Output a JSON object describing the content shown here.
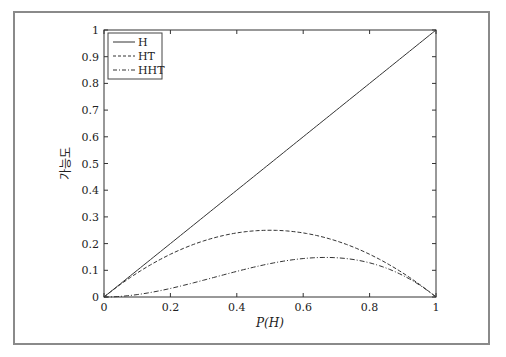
{
  "chart_data": {
    "type": "line",
    "title": "",
    "xlabel": "P(H)",
    "ylabel": "가능도",
    "xlim": [
      0,
      1
    ],
    "ylim": [
      0,
      1
    ],
    "grid": false,
    "legend_position": "upper left",
    "x_ticks": [
      "0",
      "0.2",
      "0.4",
      "0.6",
      "0.8",
      "1"
    ],
    "y_ticks": [
      "0",
      "0.1",
      "0.2",
      "0.3",
      "0.4",
      "0.5",
      "0.6",
      "0.7",
      "0.8",
      "0.9",
      "1"
    ],
    "x": [
      0,
      0.1,
      0.2,
      0.3,
      0.4,
      0.5,
      0.6,
      0.667,
      0.7,
      0.8,
      0.9,
      1.0
    ],
    "series": [
      {
        "name": "H",
        "style": "solid",
        "formula": "p",
        "values": [
          0,
          0.1,
          0.2,
          0.3,
          0.4,
          0.5,
          0.6,
          0.667,
          0.7,
          0.8,
          0.9,
          1.0
        ]
      },
      {
        "name": "HT",
        "style": "dashed",
        "formula": "p(1-p)",
        "values": [
          0,
          0.09,
          0.16,
          0.21,
          0.24,
          0.25,
          0.24,
          0.222,
          0.21,
          0.16,
          0.09,
          0
        ]
      },
      {
        "name": "HHT",
        "style": "dash-dot",
        "formula": "p^2(1-p)",
        "values": [
          0,
          0.009,
          0.032,
          0.063,
          0.096,
          0.125,
          0.144,
          0.148,
          0.147,
          0.128,
          0.081,
          0
        ]
      }
    ]
  },
  "legend": {
    "items": [
      {
        "label": "H"
      },
      {
        "label": "HT"
      },
      {
        "label": "HHT"
      }
    ]
  }
}
